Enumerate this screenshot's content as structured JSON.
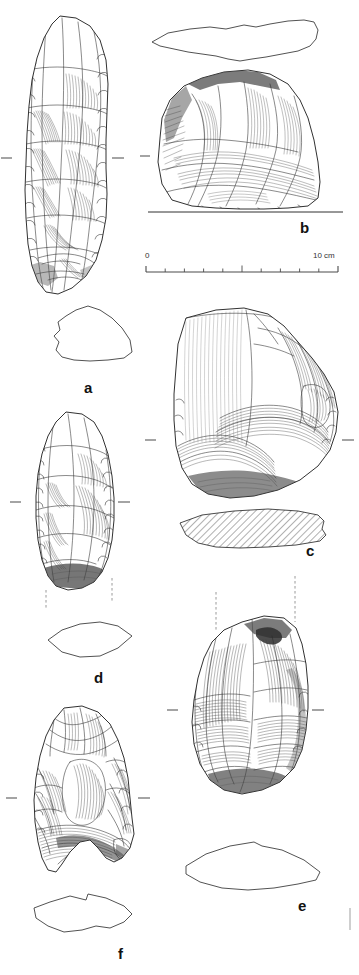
{
  "plate": {
    "kind": "archaeological-lithic-illustration-plate",
    "background_color": "#ffffff",
    "ink_color": "#1a1a1a",
    "width": 359,
    "height": 975
  },
  "scale_bar": {
    "start_label": "0",
    "end_label": "10 cm",
    "divisions": 10,
    "major_ticks_at": [
      0,
      5,
      10
    ],
    "x_start": 146,
    "x_end": 338,
    "y": 268
  },
  "artifacts": [
    {
      "id": "a",
      "label": "a",
      "label_x": 88,
      "label_y": 388,
      "view": "elongated-flake-tool",
      "has_profile": true,
      "profile_style": "outline",
      "has_axis_ticks": true,
      "has_dashed_guides": false
    },
    {
      "id": "b",
      "label": "b",
      "label_x": 300,
      "label_y": 228,
      "view": "core-fragment",
      "has_profile": true,
      "profile_style": "outline-top",
      "has_axis_ticks": true,
      "has_dashed_guides": false
    },
    {
      "id": "c",
      "label": "c",
      "label_x": 310,
      "label_y": 550,
      "view": "levallois-core",
      "has_profile": true,
      "profile_style": "hatched",
      "has_axis_ticks": true,
      "has_dashed_guides": false
    },
    {
      "id": "d",
      "label": "d",
      "label_x": 98,
      "label_y": 678,
      "view": "retouched-point",
      "has_profile": true,
      "profile_style": "lens",
      "has_axis_ticks": true,
      "has_dashed_guides": true
    },
    {
      "id": "e",
      "label": "e",
      "label_x": 302,
      "label_y": 905,
      "view": "discoidal-core",
      "has_profile": true,
      "profile_style": "curved",
      "has_axis_ticks": true,
      "has_dashed_guides": true
    },
    {
      "id": "f",
      "label": "f",
      "label_x": 122,
      "label_y": 948,
      "view": "convergent-scraper",
      "has_profile": true,
      "profile_style": "angular",
      "has_axis_ticks": true,
      "has_dashed_guides": false
    }
  ]
}
